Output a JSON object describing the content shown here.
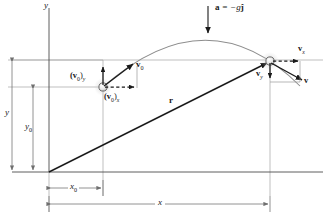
{
  "figure": {
    "type": "physics-diagram",
    "background_color": "#ffffff",
    "stroke_color": "#1a1a1a",
    "thin_line_color": "#9a9a9a",
    "marker_fill": "#e8e8e8",
    "marker_stroke": "#4a4a4a"
  },
  "axes": {
    "y_axis_label": "y",
    "x_axis_label": "",
    "origin": {
      "x": 49,
      "y": 172
    }
  },
  "acceleration": {
    "label_bold": "a",
    "label_rest": " = −g",
    "label_unit": "ĵ",
    "full_label": "a = −gĵ",
    "arrow_x": 208,
    "arrow_y_start": 6,
    "arrow_y_end": 33
  },
  "launch_point": {
    "marker_cx": 103,
    "marker_cy": 87,
    "vectors": [
      {
        "name": "v0",
        "label_bold": "v",
        "label_sub": "0",
        "kind": "resultant",
        "style": "solid"
      },
      {
        "name": "v0y",
        "label_bold": "(v",
        "label_sub": "0",
        "label_close": ")",
        "label_comp": "y",
        "kind": "component-vertical",
        "style": "solid"
      },
      {
        "name": "v0x",
        "label_bold": "(v",
        "label_sub": "0",
        "label_close": ")",
        "label_comp": "x",
        "kind": "component-horizontal",
        "style": "dashed"
      }
    ]
  },
  "landing_point": {
    "marker_cx": 270,
    "marker_cy": 61,
    "vectors": [
      {
        "name": "vx",
        "label_bold": "v",
        "label_comp": "x",
        "kind": "component-horizontal",
        "style": "dashed"
      },
      {
        "name": "vy",
        "label_bold": "v",
        "label_comp": "y",
        "kind": "component-vertical",
        "style": "solid"
      },
      {
        "name": "v",
        "label_bold": "v",
        "label_comp": "",
        "kind": "resultant",
        "style": "solid"
      }
    ]
  },
  "position_vector": {
    "label_bold": "r",
    "from_x": 49,
    "from_y": 172,
    "to_x": 268,
    "to_y": 63
  },
  "dimensions": [
    {
      "name": "y-total",
      "label_italic": "y",
      "label_sub": "",
      "orientation": "vertical",
      "line_x": 12,
      "from": 60,
      "to": 172
    },
    {
      "name": "y-initial",
      "label_italic": "y",
      "label_sub": "0",
      "orientation": "vertical",
      "line_x": 33,
      "from": 87,
      "to": 172
    },
    {
      "name": "x-initial",
      "label_italic": "x",
      "label_sub": "0",
      "orientation": "horizontal",
      "line_y": 188,
      "from": 49,
      "to": 103
    },
    {
      "name": "x-total",
      "label_italic": "x",
      "label_sub": "",
      "orientation": "horizontal",
      "line_y": 204,
      "from": 49,
      "to": 270
    }
  ],
  "trajectory": {
    "description": "parabolic arc",
    "start_x": 103,
    "start_y": 87,
    "apex_x": 210,
    "apex_y": 39,
    "end_x": 300,
    "end_y": 85
  }
}
